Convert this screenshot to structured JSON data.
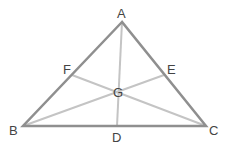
{
  "diagram": {
    "colors": {
      "sides": "#8f8f8f",
      "medians": "#c4c4c4",
      "label": "#444444"
    },
    "points": {
      "A": {
        "label": "A",
        "x": 122,
        "y": 22
      },
      "B": {
        "label": "B",
        "x": 23,
        "y": 126
      },
      "C": {
        "label": "C",
        "x": 206,
        "y": 126
      },
      "D": {
        "label": "D",
        "x": 117,
        "y": 126
      },
      "E": {
        "label": "E",
        "x": 164,
        "y": 75
      },
      "F": {
        "label": "F",
        "x": 72,
        "y": 75
      },
      "G": {
        "label": "G",
        "x": 118,
        "y": 91
      }
    },
    "sides": [
      "AB",
      "BC",
      "CA"
    ],
    "medians": [
      "AD",
      "BE",
      "CF"
    ]
  }
}
